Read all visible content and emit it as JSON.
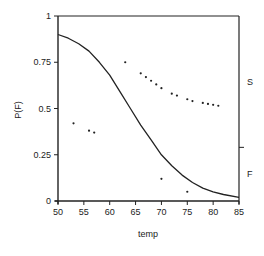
{
  "chart_data": {
    "type": "line",
    "title": "",
    "xlabel": "temp",
    "ylabel": "P(F)",
    "xlim": [
      50,
      85
    ],
    "ylim": [
      0,
      1
    ],
    "x_ticks": [
      50,
      55,
      60,
      65,
      70,
      75,
      80,
      85
    ],
    "y_ticks": [
      0,
      0.25,
      0.5,
      0.75,
      1
    ],
    "y_tick_labels": [
      "0",
      "0.25",
      "0.5",
      "0.75",
      "1"
    ],
    "grid": false,
    "right_axis": {
      "labels": [
        "S",
        "F"
      ],
      "divider_value": 0.29
    },
    "series": [
      {
        "name": "fitted curve",
        "type": "line",
        "x": [
          50,
          52,
          54,
          56,
          58,
          60,
          62,
          64,
          66,
          68,
          70,
          72,
          74,
          76,
          78,
          80,
          82,
          85
        ],
        "values": [
          0.9,
          0.88,
          0.85,
          0.81,
          0.75,
          0.68,
          0.59,
          0.5,
          0.41,
          0.33,
          0.25,
          0.19,
          0.14,
          0.1,
          0.07,
          0.05,
          0.035,
          0.02
        ]
      },
      {
        "name": "failures (plotted at predicted level)",
        "type": "scatter",
        "x": [
          53,
          56,
          57,
          63,
          70,
          75
        ],
        "values": [
          0.42,
          0.38,
          0.37,
          0.75,
          0.12,
          0.05
        ]
      },
      {
        "name": "successes (S band)",
        "type": "scatter",
        "x": [
          66,
          67,
          68,
          69,
          70,
          72,
          73,
          75,
          76,
          78,
          79,
          80,
          81
        ],
        "values": [
          0.69,
          0.67,
          0.65,
          0.63,
          0.61,
          0.58,
          0.57,
          0.55,
          0.54,
          0.53,
          0.525,
          0.52,
          0.515
        ]
      }
    ]
  }
}
